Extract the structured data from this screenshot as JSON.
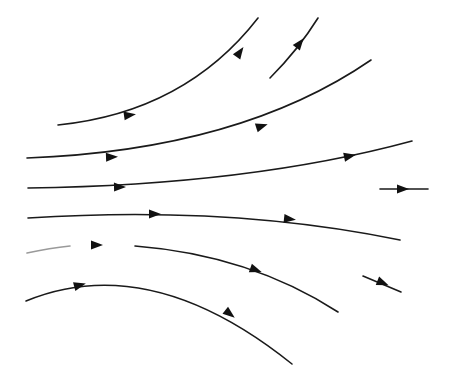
{
  "diagram": {
    "type": "streamlines",
    "colors": {
      "background": "#ffffff",
      "line": "#1a1a1a",
      "arrow": "#111111",
      "faded": "#9a9a9a"
    },
    "lines": [
      {
        "id": "streamline-1",
        "path": "M58,125 Q185,112 258,18",
        "arrows": [
          [
            130,
            115,
            -8
          ],
          [
            240,
            52,
            -55
          ]
        ]
      },
      {
        "id": "streamline-2",
        "path": "M270,78 Q298,50 318,18",
        "arrows": [
          [
            300,
            43,
            -52
          ]
        ]
      },
      {
        "id": "streamline-3",
        "path": "M27,158 Q240,150 371,60",
        "arrows": [
          [
            112,
            157,
            -2
          ],
          [
            262,
            126,
            -18
          ]
        ]
      },
      {
        "id": "streamline-4",
        "path": "M28,188 Q250,185 412,141",
        "arrows": [
          [
            120,
            187,
            -1
          ],
          [
            350,
            156,
            -12
          ]
        ]
      },
      {
        "id": "streamline-5",
        "path": "M380,189 L428,189",
        "arrows": [
          [
            403,
            189,
            0
          ]
        ]
      },
      {
        "id": "streamline-6",
        "path": "M28,218 Q230,205 400,240",
        "arrows": [
          [
            155,
            214,
            0
          ],
          [
            290,
            219,
            6
          ]
        ]
      },
      {
        "id": "streamline-7",
        "path": "M135,246 Q250,255 338,312",
        "arrows": [
          [
            256,
            270,
            20
          ]
        ],
        "faded_segment": "M27,253 Q50,248 70,246",
        "faded_arrow": [
          97,
          245,
          0
        ]
      },
      {
        "id": "streamline-8",
        "path": "M363,276 L401,292",
        "arrows": [
          [
            383,
            283,
            22
          ]
        ]
      },
      {
        "id": "streamline-9",
        "path": "M26,301 Q150,250 292,364",
        "arrows": [
          [
            80,
            285,
            -15
          ],
          [
            230,
            314,
            38
          ]
        ]
      }
    ]
  }
}
